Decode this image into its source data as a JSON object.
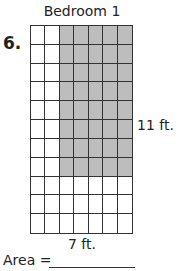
{
  "problem": {
    "number": "6.",
    "title": "Bedroom 1",
    "side_label": "11 ft.",
    "bottom_label": "7 ft.",
    "area_label": "Area =",
    "grid": {
      "columns": 7,
      "rows": 11,
      "shaded_columns_start": 3,
      "shaded_columns_end": 7,
      "shaded_rows_start": 1,
      "shaded_rows_end": 8
    },
    "colors": {
      "shade": "#bdbdbd",
      "line": "#333333"
    }
  }
}
